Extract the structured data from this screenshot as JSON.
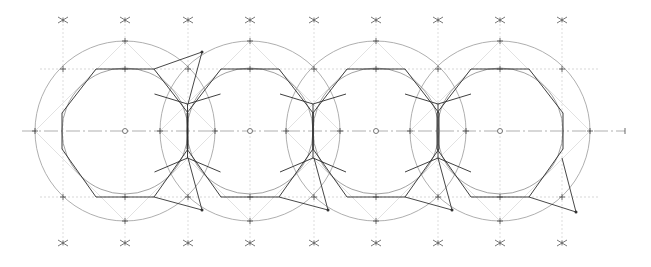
{
  "diagram": {
    "colors": {
      "background": "#ffffff",
      "construction": "#9a9a9a",
      "outline": "#2a2a2a",
      "guides": "#c6c6c6"
    },
    "units": [
      {
        "id": "ring-1",
        "label": "Ring 1"
      },
      {
        "id": "ring-2",
        "label": "Ring 2"
      },
      {
        "id": "ring-3",
        "label": "Ring 3"
      },
      {
        "id": "ring-4",
        "label": "Ring 4"
      }
    ],
    "construction_marks": {
      "top_row_count": 10,
      "bottom_row_count": 9,
      "mark_symbol": "asterisk"
    },
    "elements": {
      "outer_circle": "construction circle",
      "inner_circle": "inner construction circle",
      "octagon": "octagonal outline",
      "center_axis": "dash-dot center line",
      "bridges": "crossing link lines between rings"
    }
  }
}
